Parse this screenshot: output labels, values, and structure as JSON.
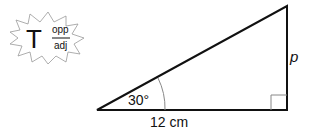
{
  "diagram": {
    "type": "right-triangle",
    "angle_label": "30°",
    "base_label": "12 cm",
    "opposite_label": "p",
    "right_angle_marker": true
  },
  "badge": {
    "icon": "tangent-formula-burst",
    "letter": "T",
    "numerator": "opp",
    "denominator": "adj"
  },
  "colors": {
    "stroke": "#111111",
    "thin_stroke": "#888888",
    "background": "#ffffff"
  }
}
